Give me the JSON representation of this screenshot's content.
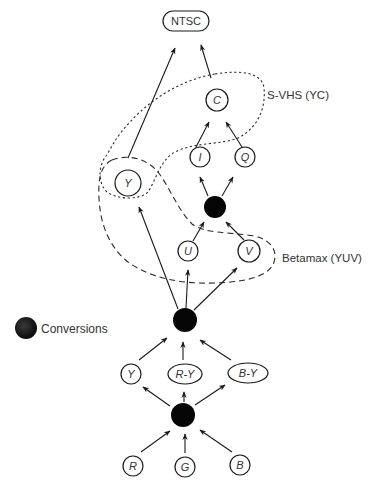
{
  "diagram": {
    "nodes": {
      "ntsc": {
        "label": "NTSC",
        "shape": "pill",
        "italic": false,
        "cx": 186,
        "cy": 21,
        "rx": 23,
        "ry": 10
      },
      "c": {
        "label": "C",
        "shape": "circle",
        "italic": true,
        "cx": 217,
        "cy": 100,
        "r": 11
      },
      "i": {
        "label": "I",
        "shape": "circle",
        "italic": true,
        "cx": 200,
        "cy": 157,
        "r": 10
      },
      "q": {
        "label": "Q",
        "shape": "circle",
        "italic": true,
        "cx": 245,
        "cy": 157,
        "r": 10
      },
      "y_upper": {
        "label": "Y",
        "shape": "circle",
        "italic": true,
        "cx": 128,
        "cy": 183,
        "r": 13
      },
      "u": {
        "label": "U",
        "shape": "circle",
        "italic": true,
        "cx": 188,
        "cy": 251,
        "r": 10
      },
      "v": {
        "label": "V",
        "shape": "circle",
        "italic": true,
        "cx": 249,
        "cy": 251,
        "r": 11
      },
      "y_lower": {
        "label": "Y",
        "shape": "circle",
        "italic": true,
        "cx": 131,
        "cy": 374,
        "r": 10
      },
      "r_minus_y": {
        "label": "R-Y",
        "shape": "ellipse",
        "italic": true,
        "cx": 185,
        "cy": 374,
        "rx": 17,
        "ry": 10
      },
      "b_minus_y": {
        "label": "B-Y",
        "shape": "ellipse",
        "italic": true,
        "cx": 248,
        "cy": 373,
        "rx": 20,
        "ry": 10
      },
      "r": {
        "label": "R",
        "shape": "circle",
        "italic": true,
        "cx": 133,
        "cy": 466,
        "r": 10
      },
      "g": {
        "label": "G",
        "shape": "circle",
        "italic": true,
        "cx": 185,
        "cy": 467,
        "r": 10
      },
      "b": {
        "label": "B",
        "shape": "circle",
        "italic": true,
        "cx": 240,
        "cy": 465,
        "r": 10
      }
    },
    "conversions": {
      "iq_conversion": {
        "cx": 215,
        "cy": 207,
        "r": 11
      },
      "yuv_conversion": {
        "cx": 185,
        "cy": 320,
        "r": 12
      },
      "rgb_conversion": {
        "cx": 183,
        "cy": 415,
        "r": 12
      }
    },
    "edges": [
      {
        "from": "y_upper",
        "to": "ntsc",
        "x1": 128,
        "y1": 158,
        "x2": 175,
        "y2": 48
      },
      {
        "from": "c",
        "to": "ntsc",
        "x1": 211,
        "y1": 78,
        "x2": 201,
        "y2": 45
      },
      {
        "from": "i",
        "to": "c",
        "x1": 196,
        "y1": 147,
        "x2": 209,
        "y2": 122
      },
      {
        "from": "q",
        "to": "c",
        "x1": 242,
        "y1": 147,
        "x2": 226,
        "y2": 122
      },
      {
        "from": "iq_conversion",
        "to": "i",
        "x1": 208,
        "y1": 196,
        "x2": 200,
        "y2": 177
      },
      {
        "from": "iq_conversion",
        "to": "q",
        "x1": 222,
        "y1": 196,
        "x2": 233,
        "y2": 177
      },
      {
        "from": "u",
        "to": "iq_conversion",
        "x1": 193,
        "y1": 241,
        "x2": 204,
        "y2": 222
      },
      {
        "from": "v",
        "to": "iq_conversion",
        "x1": 244,
        "y1": 240,
        "x2": 226,
        "y2": 222
      },
      {
        "from": "yuv_conversion",
        "to": "y_upper",
        "x1": 178,
        "y1": 309,
        "x2": 139,
        "y2": 207
      },
      {
        "from": "yuv_conversion",
        "to": "u",
        "x1": 186,
        "y1": 308,
        "x2": 188,
        "y2": 270
      },
      {
        "from": "yuv_conversion",
        "to": "v",
        "x1": 194,
        "y1": 310,
        "x2": 237,
        "y2": 268
      },
      {
        "from": "y_lower",
        "to": "yuv_conversion",
        "x1": 139,
        "y1": 360,
        "x2": 167,
        "y2": 338
      },
      {
        "from": "r_minus_y",
        "to": "yuv_conversion",
        "x1": 183,
        "y1": 360,
        "x2": 183,
        "y2": 342
      },
      {
        "from": "b_minus_y",
        "to": "yuv_conversion",
        "x1": 231,
        "y1": 360,
        "x2": 200,
        "y2": 340
      },
      {
        "from": "rgb_conversion",
        "to": "y_lower",
        "x1": 170,
        "y1": 406,
        "x2": 143,
        "y2": 387
      },
      {
        "from": "rgb_conversion",
        "to": "r_minus_y",
        "x1": 184,
        "y1": 402,
        "x2": 184,
        "y2": 392
      },
      {
        "from": "rgb_conversion",
        "to": "b_minus_y",
        "x1": 195,
        "y1": 405,
        "x2": 225,
        "y2": 385
      },
      {
        "from": "r",
        "to": "rgb_conversion",
        "x1": 141,
        "y1": 452,
        "x2": 170,
        "y2": 431
      },
      {
        "from": "g",
        "to": "rgb_conversion",
        "x1": 185,
        "y1": 453,
        "x2": 185,
        "y2": 434
      },
      {
        "from": "b",
        "to": "rgb_conversion",
        "x1": 232,
        "y1": 452,
        "x2": 200,
        "y2": 430
      }
    ],
    "groups": {
      "svhs": {
        "label": "S-VHS (YC)",
        "style": "dotted",
        "label_x": 267,
        "label_y": 99,
        "path": "M 215 74 C 240 70, 262 72, 264 88 C 266 108, 258 128, 238 138 C 220 145, 195 142, 175 152 C 160 160, 156 180, 148 192 C 140 200, 118 200, 107 192 C 98 184, 98 166, 106 156 C 112 147, 115 138, 130 122 C 150 100, 180 80, 215 74 Z"
      },
      "betamax": {
        "label": "Betamax (YUV)",
        "style": "dashed",
        "label_x": 282,
        "label_y": 262,
        "path": "M 112 160 C 128 154, 146 158, 158 172 C 170 188, 178 210, 192 224 C 205 234, 230 232, 255 236 C 270 240, 278 250, 274 262 C 270 275, 250 282, 215 283 C 180 284, 150 278, 128 262 C 108 246, 100 222, 99 198 C 98 180, 100 166, 112 160 Z"
      }
    },
    "legend": {
      "label": "Conversions",
      "dot_cx": 26,
      "dot_cy": 328,
      "dot_r": 11,
      "label_x": 41,
      "label_y": 333
    },
    "colors": {
      "ink": "#1a1a1a",
      "text": "#333333",
      "conversion_fill": "#050505",
      "background": "#ffffff"
    }
  }
}
